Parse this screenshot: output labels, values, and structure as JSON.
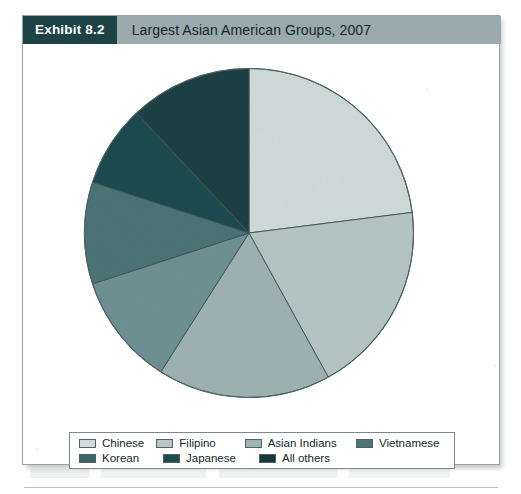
{
  "exhibit": {
    "tag": "Exhibit 8.2",
    "title": "Largest Asian American Groups, 2007"
  },
  "colors": {
    "header_bar": "#9aaaad",
    "header_tag_bg": "#1d4347",
    "header_tag_text": "#ffffff",
    "card_border": "#9aa2a3",
    "slice_stroke": "#3f5457"
  },
  "chart_data": {
    "type": "pie",
    "title": "Largest Asian American Groups, 2007",
    "start_angle_deg": 0,
    "direction": "clockwise",
    "legend_position": "bottom",
    "grid": false,
    "labels": [
      "Chinese",
      "Filipino",
      "Asian Indians",
      "Vietnamese",
      "Korean",
      "Japanese",
      "All others"
    ],
    "values": [
      23,
      19,
      17,
      11,
      10,
      8,
      12
    ],
    "unit": "percent",
    "slice_colors": [
      "#cfdcd9",
      "#b6c6c5",
      "#9fb3b3",
      "#6f9193",
      "#4c7477",
      "#1f4b50",
      "#1b4145"
    ]
  },
  "legend": {
    "row1": [
      {
        "label": "Chinese",
        "color": "#cfdcd9"
      },
      {
        "label": "Filipino",
        "color": "#b6c6c5"
      },
      {
        "label": "Asian Indians",
        "color": "#9fb3b3"
      },
      {
        "label": "Vietnamese",
        "color": "#4c7477"
      }
    ],
    "row2": [
      {
        "label": "Korean",
        "color": "#38686c"
      },
      {
        "label": "Japanese",
        "color": "#1f4b50"
      },
      {
        "label": "All others",
        "color": "#17383d"
      }
    ]
  }
}
